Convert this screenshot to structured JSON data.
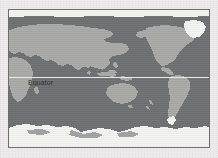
{
  "figure": {
    "kind": "world-map",
    "projection_note": "equirectangular world map, Pacific-centred",
    "annotations": [
      {
        "id": "equator",
        "label": "Equator"
      }
    ]
  },
  "map": {
    "equator_label": "Equator",
    "frame": {
      "x": 8,
      "y": 9,
      "width": 202,
      "height": 139
    },
    "equator_y_fraction": 0.486
  },
  "colors": {
    "page_background": "#eeecec",
    "frame_border": "#6d6d6d",
    "ocean": "#6f7072",
    "land": "#a9a9a7",
    "ice": "#f4f4f2",
    "equator_line": "#f2f2f0",
    "equator_text": "#17181a"
  },
  "legend": {
    "ocean_label": "Ocean",
    "land_label": "Land",
    "ice_label": "Ice sheet"
  }
}
